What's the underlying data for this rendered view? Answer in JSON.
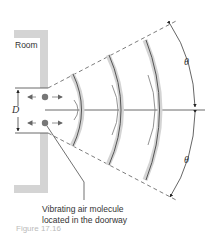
{
  "diagram": {
    "room_label": "Room",
    "opening_label": "D",
    "angle_top_label": "θ",
    "angle_bottom_label": "θ",
    "molecule_caption_line1": "Vibrating air molecule",
    "molecule_caption_line2": "located in the doorway",
    "figure_caption": "Figure 17.16",
    "colors": {
      "wall": "#d4d4d4",
      "line": "#444444",
      "wavefront": "#555555",
      "wavefront_shadow": "#cfcfcf",
      "molecule": "#777777"
    }
  }
}
